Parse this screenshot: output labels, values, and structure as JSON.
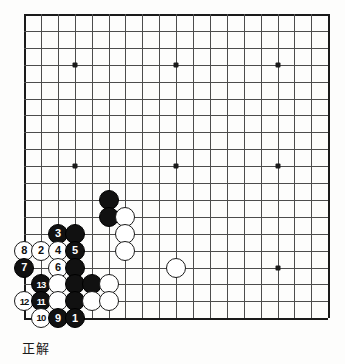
{
  "caption": "正解",
  "board": {
    "size": 19,
    "origin": {
      "x": 24,
      "y": 14
    },
    "spacing": 16.9,
    "line_color": "#4c4c4c",
    "edge_color": "#1a1a1a",
    "background": "#fdfdfc",
    "star_points": [
      {
        "col": 3,
        "row": 3
      },
      {
        "col": 9,
        "row": 3
      },
      {
        "col": 15,
        "row": 3
      },
      {
        "col": 3,
        "row": 9
      },
      {
        "col": 9,
        "row": 9
      },
      {
        "col": 15,
        "row": 9
      },
      {
        "col": 3,
        "row": 15
      },
      {
        "col": 9,
        "row": 15
      },
      {
        "col": 15,
        "row": 15
      }
    ]
  },
  "colors": {
    "black": "#111111",
    "white": "#ffffff"
  },
  "stones": [
    {
      "col": 5,
      "row": 11,
      "color": "black",
      "label": ""
    },
    {
      "col": 5,
      "row": 12,
      "color": "black",
      "label": ""
    },
    {
      "col": 6,
      "row": 12,
      "color": "white",
      "label": ""
    },
    {
      "col": 2,
      "row": 13,
      "color": "black",
      "label": "3"
    },
    {
      "col": 3,
      "row": 13,
      "color": "black",
      "label": ""
    },
    {
      "col": 6,
      "row": 13,
      "color": "white",
      "label": ""
    },
    {
      "col": 0,
      "row": 14,
      "color": "white",
      "label": "8"
    },
    {
      "col": 1,
      "row": 14,
      "color": "white",
      "label": "2"
    },
    {
      "col": 2,
      "row": 14,
      "color": "white",
      "label": "4"
    },
    {
      "col": 3,
      "row": 14,
      "color": "black",
      "label": "5"
    },
    {
      "col": 6,
      "row": 14,
      "color": "white",
      "label": ""
    },
    {
      "col": 0,
      "row": 15,
      "color": "black",
      "label": "7"
    },
    {
      "col": 2,
      "row": 15,
      "color": "white",
      "label": "6"
    },
    {
      "col": 3,
      "row": 15,
      "color": "black",
      "label": ""
    },
    {
      "col": 1,
      "row": 16,
      "color": "black",
      "label": "13"
    },
    {
      "col": 2,
      "row": 16,
      "color": "white",
      "label": ""
    },
    {
      "col": 3,
      "row": 16,
      "color": "black",
      "label": ""
    },
    {
      "col": 4,
      "row": 16,
      "color": "black",
      "label": ""
    },
    {
      "col": 5,
      "row": 16,
      "color": "white",
      "label": ""
    },
    {
      "col": 0,
      "row": 17,
      "color": "white",
      "label": "12"
    },
    {
      "col": 1,
      "row": 17,
      "color": "black",
      "label": "11"
    },
    {
      "col": 2,
      "row": 17,
      "color": "white",
      "label": ""
    },
    {
      "col": 3,
      "row": 17,
      "color": "black",
      "label": ""
    },
    {
      "col": 4,
      "row": 17,
      "color": "white",
      "label": ""
    },
    {
      "col": 5,
      "row": 17,
      "color": "white",
      "label": ""
    },
    {
      "col": 1,
      "row": 18,
      "color": "white",
      "label": "10"
    },
    {
      "col": 2,
      "row": 18,
      "color": "black",
      "label": "9"
    },
    {
      "col": 3,
      "row": 18,
      "color": "black",
      "label": "1"
    },
    {
      "col": 9,
      "row": 15,
      "color": "white",
      "label": ""
    }
  ]
}
